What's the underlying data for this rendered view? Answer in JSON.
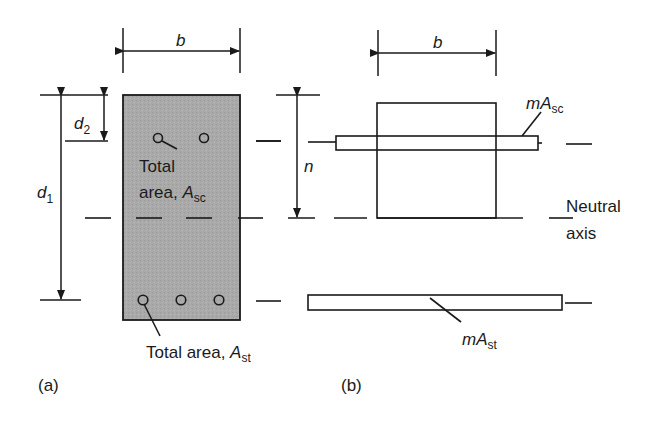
{
  "figure": {
    "panel_a": {
      "label": "(a)",
      "width_dim": "b",
      "depth_dim_d1": "d",
      "depth_dim_d1_sub": "1",
      "depth_dim_d2": "d",
      "depth_dim_d2_sub": "2",
      "compression_label_line1": "Total",
      "compression_label_line2": "area, ",
      "compression_label_sym": "A",
      "compression_label_sub": "sc",
      "tension_label": "Total area, ",
      "tension_label_sym": "A",
      "tension_label_sub": "st"
    },
    "panel_b": {
      "label": "(b)",
      "width_dim": "b",
      "na_depth_dim": "n",
      "compression_steel_prefix": "m",
      "compression_steel_sym": "A",
      "compression_steel_sub": "sc",
      "tension_steel_prefix": "m",
      "tension_steel_sym": "A",
      "tension_steel_sub": "st",
      "neutral_axis_line1": "Neutral",
      "neutral_axis_line2": "axis"
    },
    "colors": {
      "section_fill": "#a9a9a9",
      "line": "#1a1a1a",
      "background": "#ffffff"
    }
  }
}
